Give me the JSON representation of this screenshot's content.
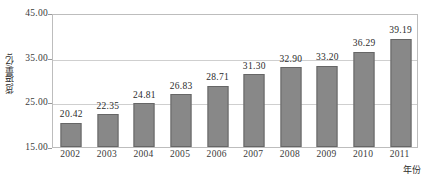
{
  "chart_data": {
    "type": "bar",
    "title": "",
    "xlabel": "年份",
    "ylabel": "货运量/亿t",
    "categories": [
      "2002",
      "2003",
      "2004",
      "2005",
      "2006",
      "2007",
      "2008",
      "2009",
      "2010",
      "2011"
    ],
    "values": [
      20.42,
      22.35,
      24.81,
      26.83,
      28.71,
      31.3,
      32.9,
      33.2,
      36.29,
      39.19
    ],
    "value_labels": [
      "20.42",
      "22.35",
      "24.81",
      "26.83",
      "28.71",
      "31.30",
      "32.90",
      "33.20",
      "36.29",
      "39.19"
    ],
    "ylim": [
      15.0,
      45.0
    ],
    "yticks": [
      45.0,
      35.0,
      25.0,
      15.0
    ],
    "ytick_labels": [
      "45.00",
      "35.00",
      "25.00",
      "15.00"
    ],
    "grid": true,
    "legend": "none",
    "bar_color": "#888888",
    "bar_border_color": "#666666",
    "gridline_color": "#cfcfcf",
    "axis_color": "#bdbdbd",
    "text_color": "#2b2b2b"
  }
}
